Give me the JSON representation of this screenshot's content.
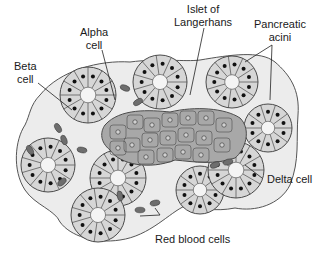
{
  "diagram": {
    "labels": {
      "alpha": [
        "Alpha",
        "cell"
      ],
      "beta": [
        "Beta",
        "cell"
      ],
      "islet": [
        "Islet of",
        "Langerhans"
      ],
      "acini": [
        "Pancreatic",
        "acini"
      ],
      "delta": "Delta cell",
      "rbc": "Red blood cells"
    },
    "colors": {
      "acinar_cell": "#d6d6d6",
      "islet_cell": "#a8a8a8",
      "stroma": "#ececec",
      "outline": "#4a4a4a",
      "nucleus": "#111111",
      "rbc": "#6e6e6e"
    }
  }
}
